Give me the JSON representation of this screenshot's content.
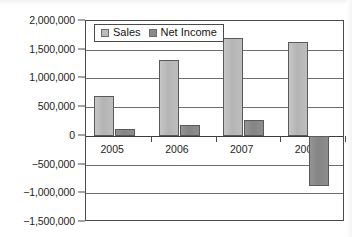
{
  "chart_data": {
    "type": "bar",
    "title": "",
    "subtitle": "",
    "xlabel": "",
    "ylabel": "",
    "categories": [
      "2005",
      "2006",
      "2007",
      "2008"
    ],
    "series": [
      {
        "name": "Sales",
        "color": "#bcbcbc",
        "values": [
          700000,
          1320000,
          1710000,
          1630000
        ]
      },
      {
        "name": "Net Income",
        "color": "#8a8a8a",
        "values": [
          120000,
          190000,
          275000,
          -880000
        ]
      }
    ],
    "ylim": [
      -1500000,
      2000000
    ],
    "ytick_step": 500000,
    "ytick_labels": [
      "2,000,000",
      "1,500,000",
      "1,000,000",
      "500,000",
      "0",
      "−500,000",
      "−1,000,000",
      "−1,500,000"
    ],
    "ytick_values": [
      2000000,
      1500000,
      1000000,
      500000,
      0,
      -500000,
      -1000000,
      -1500000
    ],
    "grid": true,
    "grid_axis": "y",
    "legend": {
      "position": "top-left-inside",
      "entries": [
        "Sales",
        "Net Income"
      ]
    }
  }
}
